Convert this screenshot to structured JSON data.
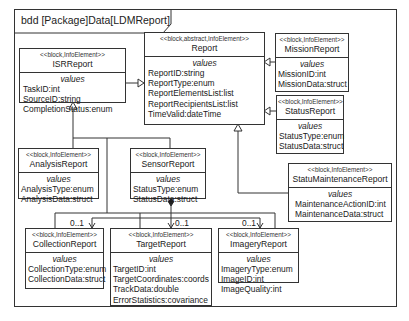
{
  "frame": {
    "title": "bdd [Package]Data[LDMReport]"
  },
  "blocks": {
    "isr": {
      "stereotype": "<<block,InfoElement>>",
      "name": "ISRReport",
      "compartment": "values",
      "values": [
        "TaskID:int",
        "SourceID:string",
        "CompletionStatus:enum"
      ]
    },
    "report": {
      "stereotype": "<<block,abstract,InfoElement>>",
      "name": "Report",
      "compartment": "values",
      "values": [
        "ReportID:string",
        "ReportType:enum",
        "ReportElementsList:list",
        "ReportRecipientsList:list",
        "TimeValid:dateTime"
      ]
    },
    "mission": {
      "stereotype": "<<block,InfoElement>>",
      "name": "MissionReport",
      "compartment": "values",
      "values": [
        "MissionID:int",
        "MissionData:struct"
      ]
    },
    "status": {
      "stereotype": "<<block,InfoElement>>",
      "name": "StatusReport",
      "compartment": "values",
      "values": [
        "StatusType:enum",
        "StatusData:struct"
      ]
    },
    "analysis": {
      "stereotype": "<<block,InfoElement>>",
      "name": "AnalysisReport",
      "compartment": "values",
      "values": [
        "AnalysisType:enum",
        "AnalysisData:struct"
      ]
    },
    "sensor": {
      "stereotype": "<<block,InfoElement>>",
      "name": "SensorReport",
      "compartment": "values",
      "values": [
        "StatusType:enum",
        "StatusData:struct"
      ]
    },
    "maintenance": {
      "stereotype": "<<block,InfoElement>>",
      "name": "StatuMaintenanceReport",
      "compartment": "values",
      "values": [
        "MaintenanceActionID:int",
        "MaintenanceData:struct"
      ]
    },
    "collection": {
      "stereotype": "<<block,InfoElement>>",
      "name": "CollectionReport",
      "compartment": "values",
      "values": [
        "CollectionType:enum",
        "CollectionData:struct"
      ]
    },
    "target": {
      "stereotype": "<<block,InfoElement>>",
      "name": "TargetReport",
      "compartment": "values",
      "values": [
        "TargetID:int",
        "TargetCoordinates:coords",
        "TrackData:double",
        "ErrorStatistics:covariance"
      ]
    },
    "imagery": {
      "stereotype": "<<block,InfoElement>>",
      "name": "ImageryReport",
      "compartment": "values",
      "values": [
        "ImageryType:enum",
        "ImageID:int",
        "ImageQuality:int"
      ]
    }
  },
  "multiplicities": {
    "collection": "0..1",
    "target": "0..1",
    "imagery": "0..1"
  },
  "colors": {
    "line": "#333333",
    "background": "#ffffff"
  }
}
